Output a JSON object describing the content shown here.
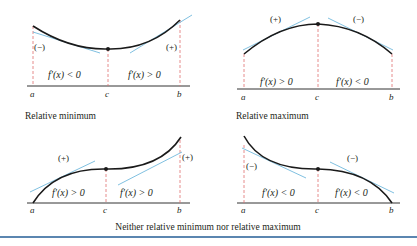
{
  "colors": {
    "curve": "#1a1a1a",
    "tangent": "#5fb0d8",
    "dashed_guide": "#e07070",
    "axis": "#333333",
    "rule": "#5b86b0"
  },
  "panels": [
    {
      "caption": "Relative minimum",
      "left_sign": "(−)",
      "right_sign": "(+)",
      "left_derivative": "f′(x) < 0",
      "right_derivative": "f′(x) > 0",
      "ticks": [
        "a",
        "c",
        "b"
      ]
    },
    {
      "caption": "Relative maximum",
      "left_sign": "(+)",
      "right_sign": "(−)",
      "left_derivative": "f′(x) > 0",
      "right_derivative": "f′(x) < 0",
      "ticks": [
        "a",
        "c",
        "b"
      ]
    },
    {
      "left_sign": "(+)",
      "right_sign": "(+)",
      "left_derivative": "f′(x) > 0",
      "right_derivative": "f′(x) > 0",
      "ticks": [
        "a",
        "c",
        "b"
      ]
    },
    {
      "left_sign": "(−)",
      "right_sign": "(−)",
      "left_derivative": "f′(x) < 0",
      "right_derivative": "f′(x) < 0",
      "ticks": [
        "a",
        "c",
        "b"
      ]
    }
  ],
  "bottom_caption": "Neither relative minimum nor relative maximum"
}
